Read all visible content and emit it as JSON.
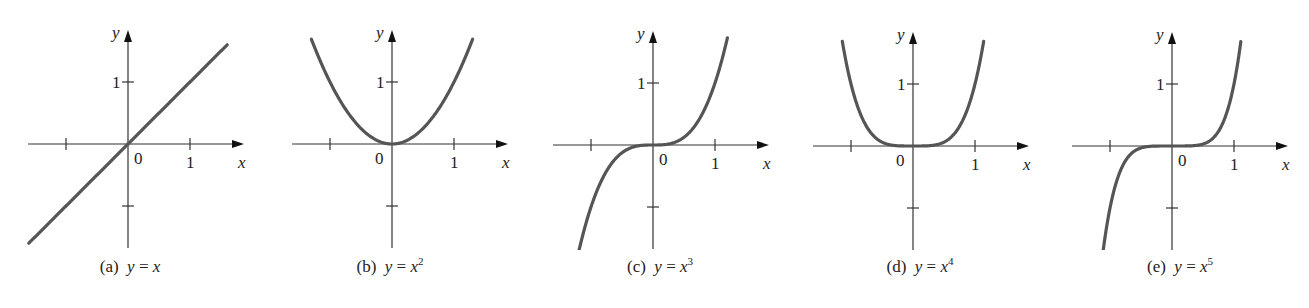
{
  "figure": {
    "curve_color": "#555555",
    "axis_color": "#333333",
    "unit_px": 62
  },
  "chart_data": [
    {
      "type": "line",
      "id": "a",
      "function": "y = x",
      "exponent": 1,
      "caption_label": "(a)",
      "caption_lhs": "y",
      "caption_eq": " = ",
      "caption_rhs": "x",
      "caption_power": "",
      "x_range": [
        -1.6,
        1.6
      ],
      "y_range": [
        -1.6,
        1.6
      ],
      "xlabel": "x",
      "ylabel": "y",
      "xticks": [
        -1,
        1
      ],
      "yticks": [
        -1,
        1
      ],
      "tick_labels": {
        "x": "1",
        "y": "1",
        "origin": "0"
      },
      "grid": false,
      "origin_px": [
        128,
        144
      ],
      "panel_left": 0
    },
    {
      "type": "line",
      "id": "b",
      "function": "y = x^2",
      "exponent": 2,
      "caption_label": "(b)",
      "caption_lhs": "y",
      "caption_eq": " = ",
      "caption_rhs": "x",
      "caption_power": "2",
      "x_range": [
        -1.3,
        1.3
      ],
      "y_range": [
        0,
        1.7
      ],
      "xlabel": "x",
      "ylabel": "y",
      "xticks": [
        -1,
        1
      ],
      "yticks": [
        -1,
        1
      ],
      "tick_labels": {
        "x": "1",
        "y": "1",
        "origin": "0"
      },
      "grid": false,
      "origin_px": [
        132,
        144
      ],
      "panel_left": 260
    },
    {
      "type": "line",
      "id": "c",
      "function": "y = x^3",
      "exponent": 3,
      "caption_label": "(c)",
      "caption_lhs": "y",
      "caption_eq": " = ",
      "caption_rhs": "x",
      "caption_power": "3",
      "x_range": [
        -1.2,
        1.2
      ],
      "y_range": [
        -1.7,
        1.7
      ],
      "xlabel": "x",
      "ylabel": "y",
      "xticks": [
        -1,
        1
      ],
      "yticks": [
        -1,
        1
      ],
      "tick_labels": {
        "x": "1",
        "y": "1",
        "origin": "0"
      },
      "grid": false,
      "origin_px": [
        123,
        145
      ],
      "panel_left": 530
    },
    {
      "type": "line",
      "id": "d",
      "function": "y = x^4",
      "exponent": 4,
      "caption_label": "(d)",
      "caption_lhs": "y",
      "caption_eq": " = ",
      "caption_rhs": "x",
      "caption_power": "4",
      "x_range": [
        -1.14,
        1.14
      ],
      "y_range": [
        0,
        1.7
      ],
      "xlabel": "x",
      "ylabel": "y",
      "xticks": [
        -1,
        1
      ],
      "yticks": [
        -1,
        1
      ],
      "tick_labels": {
        "x": "1",
        "y": "1",
        "origin": "0"
      },
      "grid": false,
      "origin_px": [
        123,
        146
      ],
      "panel_left": 790
    },
    {
      "type": "line",
      "id": "e",
      "function": "y = x^5",
      "exponent": 5,
      "caption_label": "(e)",
      "caption_lhs": "y",
      "caption_eq": " = ",
      "caption_rhs": "x",
      "caption_power": "5",
      "x_range": [
        -1.11,
        1.11
      ],
      "y_range": [
        -1.7,
        1.7
      ],
      "xlabel": "x",
      "ylabel": "y",
      "xticks": [
        -1,
        1
      ],
      "yticks": [
        -1,
        1
      ],
      "tick_labels": {
        "x": "1",
        "y": "1",
        "origin": "0"
      },
      "grid": false,
      "origin_px": [
        122,
        146
      ],
      "panel_left": 1050
    }
  ]
}
